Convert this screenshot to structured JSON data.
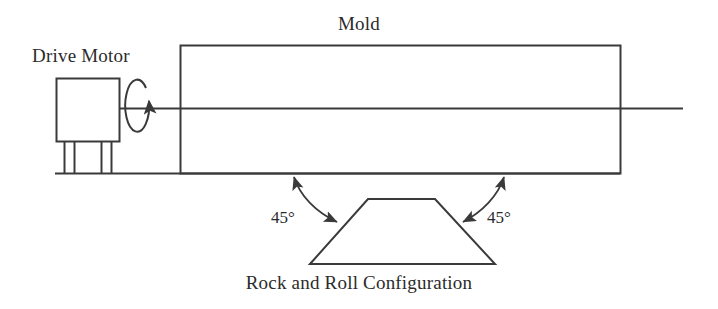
{
  "figure": {
    "background_color": "#ffffff",
    "stroke_color": "#3a3a3a",
    "text_color": "#2b2b2b",
    "width": 718,
    "height": 309
  },
  "labels": {
    "drive_motor": "Drive Motor",
    "mold": "Mold",
    "configuration": "Rock and Roll Configuration",
    "angle_left": "45°",
    "angle_right": "45°"
  },
  "parts": {
    "drive_motor_box": {
      "name": "drive-motor-box",
      "x": 56,
      "y": 78,
      "width": 63,
      "height": 63
    },
    "motor_legs": {
      "name": "motor-legs",
      "x_positions": [
        64,
        74,
        101,
        111
      ],
      "top": 141,
      "bottom": 173
    },
    "ground_line": {
      "name": "ground-line",
      "x1": 55,
      "y1": 173,
      "x2": 620,
      "y2": 173
    },
    "drive_shaft": {
      "name": "drive-shaft",
      "x1": 119,
      "y1": 108,
      "x2": 683,
      "y2": 108
    },
    "mold_body": {
      "name": "mold-rectangle",
      "x": 180,
      "y": 45,
      "width": 440,
      "height": 128
    },
    "rotation_arrow": {
      "name": "rotation-arrow",
      "center_x": 139,
      "center_y": 108,
      "radius_x": 12,
      "radius_y": 26,
      "direction": "clockwise"
    },
    "rock_platform": {
      "name": "rock-and-roll-trapezoid",
      "top_left_x": 368,
      "top_right_x": 435,
      "top_y": 199,
      "bottom_left_x": 310,
      "bottom_right_x": 495,
      "bottom_y": 264
    },
    "angle_arc_left": {
      "name": "angle-arc-left",
      "start_x": 293,
      "start_y": 176,
      "end_x": 339,
      "end_y": 223,
      "double_headed": true
    },
    "angle_arc_right": {
      "name": "angle-arc-right",
      "start_x": 505,
      "start_y": 176,
      "end_x": 461,
      "end_y": 223,
      "double_headed": true
    }
  }
}
